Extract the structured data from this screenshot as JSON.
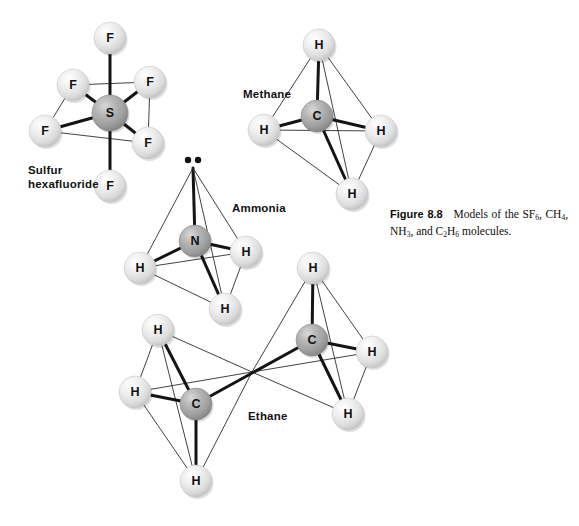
{
  "figure": {
    "caption_label": "Figure 8.8",
    "caption_text": "Models of the SF6, CH4, NH3, and C2H6 molecules.",
    "caption_parts": {
      "lead": "Models of the SF",
      "sub1": "6",
      "mid1": ", CH",
      "sub2": "4",
      "mid2": ", NH",
      "sub3": "3",
      "mid3": ", and C",
      "sub4": "2",
      "mid4": "H",
      "sub5": "6",
      "tail": " molecules."
    }
  },
  "colors": {
    "background": "#ffffff",
    "atom_light": "#e8e8e8",
    "atom_light_edge": "#c9c9c9",
    "atom_dark": "#a8a8a8",
    "atom_dark_edge": "#8a8a8a",
    "bond_strong": "#141414",
    "bond_thin": "#2b2b2b",
    "text": "#111111"
  },
  "molecules": [
    {
      "id": "sulfur-hexafluoride",
      "label": "Sulfur\nhexafluoride",
      "formula": "SF6",
      "geometry": "octahedral",
      "center_atom": "S",
      "ligand_atom": "F",
      "ligand_count": 6,
      "atoms": [
        {
          "symbol": "S",
          "kind": "dark",
          "x": 110,
          "y": 113,
          "r": 18
        },
        {
          "symbol": "F",
          "kind": "light",
          "x": 110,
          "y": 38,
          "r": 16
        },
        {
          "symbol": "F",
          "kind": "light",
          "x": 110,
          "y": 186,
          "r": 16
        },
        {
          "symbol": "F",
          "kind": "light",
          "x": 73,
          "y": 85,
          "r": 16
        },
        {
          "symbol": "F",
          "kind": "light",
          "x": 150,
          "y": 82,
          "r": 16
        },
        {
          "symbol": "F",
          "kind": "light",
          "x": 45,
          "y": 131,
          "r": 16
        },
        {
          "symbol": "F",
          "kind": "light",
          "x": 148,
          "y": 143,
          "r": 16
        }
      ],
      "bonds": [
        {
          "from": 0,
          "to": 1,
          "weight": "strong"
        },
        {
          "from": 0,
          "to": 2,
          "weight": "strong"
        },
        {
          "from": 0,
          "to": 3,
          "weight": "strong"
        },
        {
          "from": 0,
          "to": 4,
          "weight": "strong"
        },
        {
          "from": 0,
          "to": 5,
          "weight": "strong"
        },
        {
          "from": 0,
          "to": 6,
          "weight": "strong"
        }
      ],
      "edges": [
        {
          "from": 3,
          "to": 4,
          "weight": "thin"
        },
        {
          "from": 5,
          "to": 6,
          "weight": "thin"
        },
        {
          "from": 3,
          "to": 5,
          "weight": "thin"
        },
        {
          "from": 4,
          "to": 6,
          "weight": "thin"
        }
      ]
    },
    {
      "id": "methane",
      "label": "Methane",
      "formula": "CH4",
      "geometry": "tetrahedral",
      "center_atom": "C",
      "ligand_atom": "H",
      "ligand_count": 4,
      "atoms": [
        {
          "symbol": "C",
          "kind": "dark",
          "x": 317,
          "y": 116,
          "r": 16
        },
        {
          "symbol": "H",
          "kind": "light",
          "x": 319,
          "y": 45,
          "r": 16
        },
        {
          "symbol": "H",
          "kind": "light",
          "x": 264,
          "y": 130,
          "r": 16
        },
        {
          "symbol": "H",
          "kind": "light",
          "x": 381,
          "y": 131,
          "r": 16
        },
        {
          "symbol": "H",
          "kind": "light",
          "x": 352,
          "y": 194,
          "r": 16
        }
      ],
      "bonds": [
        {
          "from": 0,
          "to": 1,
          "weight": "strong"
        },
        {
          "from": 0,
          "to": 2,
          "weight": "strong"
        },
        {
          "from": 0,
          "to": 3,
          "weight": "strong"
        },
        {
          "from": 0,
          "to": 4,
          "weight": "strong"
        }
      ],
      "edges": [
        {
          "from": 1,
          "to": 2,
          "weight": "thin"
        },
        {
          "from": 1,
          "to": 3,
          "weight": "thin"
        },
        {
          "from": 1,
          "to": 4,
          "weight": "thin"
        },
        {
          "from": 2,
          "to": 3,
          "weight": "thin"
        },
        {
          "from": 2,
          "to": 4,
          "weight": "thin"
        },
        {
          "from": 3,
          "to": 4,
          "weight": "thin"
        }
      ]
    },
    {
      "id": "ammonia",
      "label": "Ammonia",
      "formula": "NH3",
      "geometry": "trigonal pyramidal",
      "center_atom": "N",
      "ligand_atom": "H",
      "ligand_count": 3,
      "lone_pair": true,
      "lone_pair_dots": 2,
      "atoms": [
        {
          "symbol": "N",
          "kind": "dark",
          "x": 195,
          "y": 241,
          "r": 16
        },
        {
          "symbol": "H",
          "kind": "light",
          "x": 140,
          "y": 268,
          "r": 16
        },
        {
          "symbol": "H",
          "kind": "light",
          "x": 246,
          "y": 252,
          "r": 16
        },
        {
          "symbol": "H",
          "kind": "light",
          "x": 225,
          "y": 309,
          "r": 16
        }
      ],
      "apex": {
        "x": 193,
        "y": 168
      },
      "bonds": [
        {
          "from": 0,
          "to": 1,
          "weight": "strong"
        },
        {
          "from": 0,
          "to": 2,
          "weight": "strong"
        },
        {
          "from": 0,
          "to": 3,
          "weight": "strong"
        }
      ],
      "edges": [
        {
          "from": 1,
          "to": 2,
          "weight": "thin"
        },
        {
          "from": 1,
          "to": 3,
          "weight": "thin"
        },
        {
          "from": 2,
          "to": 3,
          "weight": "thin"
        }
      ]
    },
    {
      "id": "ethane",
      "label": "Ethane",
      "formula": "C2H6",
      "geometry": "two linked tetrahedra",
      "center_atom": "C",
      "ligand_atom": "H",
      "ligand_count": 6,
      "atoms": [
        {
          "symbol": "C",
          "kind": "dark",
          "x": 196,
          "y": 404,
          "r": 16
        },
        {
          "symbol": "C",
          "kind": "dark",
          "x": 312,
          "y": 340,
          "r": 16
        },
        {
          "symbol": "H",
          "kind": "light",
          "x": 158,
          "y": 330,
          "r": 16
        },
        {
          "symbol": "H",
          "kind": "light",
          "x": 135,
          "y": 392,
          "r": 16
        },
        {
          "symbol": "H",
          "kind": "light",
          "x": 196,
          "y": 481,
          "r": 16
        },
        {
          "symbol": "H",
          "kind": "light",
          "x": 313,
          "y": 268,
          "r": 16
        },
        {
          "symbol": "H",
          "kind": "light",
          "x": 372,
          "y": 352,
          "r": 16
        },
        {
          "symbol": "H",
          "kind": "light",
          "x": 348,
          "y": 414,
          "r": 16
        }
      ],
      "junction": {
        "x": 252,
        "y": 372
      },
      "bonds": [
        {
          "from": 0,
          "to": 2,
          "weight": "strong"
        },
        {
          "from": 0,
          "to": 3,
          "weight": "strong"
        },
        {
          "from": 0,
          "to": 4,
          "weight": "strong"
        },
        {
          "from": 1,
          "to": 5,
          "weight": "strong"
        },
        {
          "from": 1,
          "to": 6,
          "weight": "strong"
        },
        {
          "from": 1,
          "to": 7,
          "weight": "strong"
        },
        {
          "from": 0,
          "to": 1,
          "weight": "strong"
        }
      ],
      "edges": [
        {
          "from": 2,
          "to": 3,
          "weight": "thin"
        },
        {
          "from": 2,
          "to": 4,
          "weight": "thin"
        },
        {
          "from": 3,
          "to": 4,
          "weight": "thin"
        },
        {
          "from": 5,
          "to": 6,
          "weight": "thin"
        },
        {
          "from": 5,
          "to": 7,
          "weight": "thin"
        },
        {
          "from": 6,
          "to": 7,
          "weight": "thin"
        }
      ],
      "junction_edges": [
        2,
        3,
        4,
        5,
        6,
        7
      ]
    }
  ]
}
